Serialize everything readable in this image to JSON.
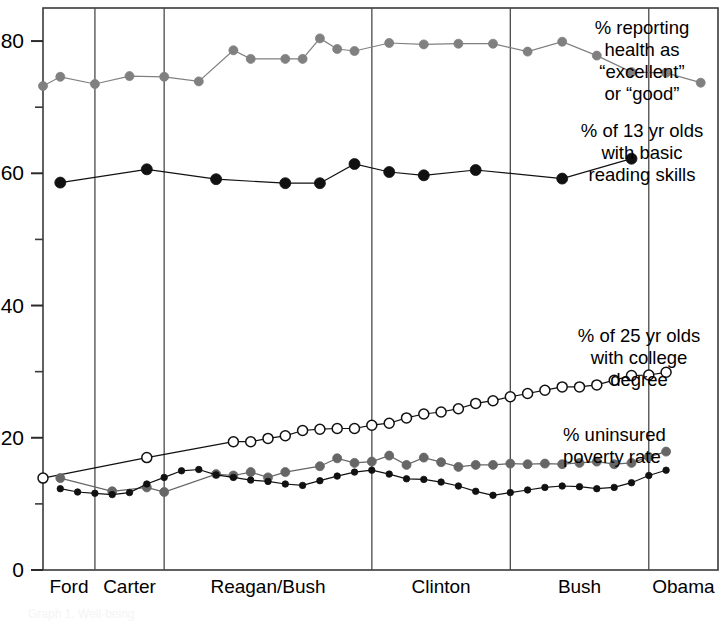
{
  "chart_data": {
    "type": "line",
    "title": "",
    "subtitle": "",
    "xlabel": "",
    "ylabel": "",
    "ylim": [
      0,
      85
    ],
    "yticks": [
      0,
      20,
      40,
      60,
      80
    ],
    "ytick_labels": [
      "0",
      "20",
      "40",
      "60",
      "80"
    ],
    "yminor": [
      10,
      30,
      50,
      70
    ],
    "grid": false,
    "legend_position": "right-inline",
    "xlim": [
      1974,
      2013
    ],
    "periods": [
      {
        "label": "Ford",
        "start": 1974,
        "end": 1977
      },
      {
        "label": "Carter",
        "start": 1977,
        "end": 1981
      },
      {
        "label": "Reagan/Bush",
        "start": 1981,
        "end": 1993
      },
      {
        "label": "Clinton",
        "start": 1993,
        "end": 2001
      },
      {
        "label": "Bush",
        "start": 2001,
        "end": 2009
      },
      {
        "label": "Obama",
        "start": 2009,
        "end": 2013
      }
    ],
    "series": [
      {
        "name": "% reporting health as “excellent” or “good”",
        "annotation": "% reporting\nhealth as\n“excellent”\nor  “good”",
        "marker": "filled-circle",
        "color": "#808080",
        "marker_size": 9,
        "points": [
          {
            "x": 1974,
            "y": 73.2
          },
          {
            "x": 1975,
            "y": 74.6
          },
          {
            "x": 1977,
            "y": 73.5
          },
          {
            "x": 1979,
            "y": 74.7
          },
          {
            "x": 1981,
            "y": 74.6
          },
          {
            "x": 1983,
            "y": 73.9
          },
          {
            "x": 1985,
            "y": 78.6
          },
          {
            "x": 1986,
            "y": 77.3
          },
          {
            "x": 1988,
            "y": 77.3
          },
          {
            "x": 1989,
            "y": 77.3
          },
          {
            "x": 1990,
            "y": 80.4
          },
          {
            "x": 1991,
            "y": 78.8
          },
          {
            "x": 1992,
            "y": 78.5
          },
          {
            "x": 1994,
            "y": 79.7
          },
          {
            "x": 1996,
            "y": 79.5
          },
          {
            "x": 1998,
            "y": 79.6
          },
          {
            "x": 2000,
            "y": 79.6
          },
          {
            "x": 2002,
            "y": 78.4
          },
          {
            "x": 2004,
            "y": 79.9
          },
          {
            "x": 2006,
            "y": 77.8
          },
          {
            "x": 2008,
            "y": 75.3
          },
          {
            "x": 2010,
            "y": 75.2
          },
          {
            "x": 2012,
            "y": 73.7
          }
        ]
      },
      {
        "name": "% of 13 yr olds with basic reading skills",
        "annotation": "% of 13 yr olds\nwith basic\nreading skills",
        "marker": "filled-circle",
        "color": "#111111",
        "marker_size": 11,
        "points": [
          {
            "x": 1975,
            "y": 58.6
          },
          {
            "x": 1980,
            "y": 60.6
          },
          {
            "x": 1984,
            "y": 59.1
          },
          {
            "x": 1988,
            "y": 58.5
          },
          {
            "x": 1990,
            "y": 58.5
          },
          {
            "x": 1992,
            "y": 61.4
          },
          {
            "x": 1994,
            "y": 60.2
          },
          {
            "x": 1996,
            "y": 59.7
          },
          {
            "x": 1999,
            "y": 60.5
          },
          {
            "x": 2004,
            "y": 59.2
          },
          {
            "x": 2008,
            "y": 62.2
          }
        ]
      },
      {
        "name": "% of 25 yr olds with college degree",
        "annotation": "% of 25 yr olds\nwith college\ndegree",
        "marker": "open-circle",
        "color": "#111111",
        "marker_size": 10,
        "points": [
          {
            "x": 1974,
            "y": 13.9
          },
          {
            "x": 1980,
            "y": 17.0
          },
          {
            "x": 1985,
            "y": 19.4
          },
          {
            "x": 1986,
            "y": 19.4
          },
          {
            "x": 1987,
            "y": 19.9
          },
          {
            "x": 1988,
            "y": 20.3
          },
          {
            "x": 1989,
            "y": 21.1
          },
          {
            "x": 1990,
            "y": 21.3
          },
          {
            "x": 1991,
            "y": 21.4
          },
          {
            "x": 1992,
            "y": 21.4
          },
          {
            "x": 1993,
            "y": 21.9
          },
          {
            "x": 1994,
            "y": 22.2
          },
          {
            "x": 1995,
            "y": 23.0
          },
          {
            "x": 1996,
            "y": 23.6
          },
          {
            "x": 1997,
            "y": 23.9
          },
          {
            "x": 1998,
            "y": 24.4
          },
          {
            "x": 1999,
            "y": 25.2
          },
          {
            "x": 2000,
            "y": 25.6
          },
          {
            "x": 2001,
            "y": 26.2
          },
          {
            "x": 2002,
            "y": 26.7
          },
          {
            "x": 2003,
            "y": 27.2
          },
          {
            "x": 2004,
            "y": 27.7
          },
          {
            "x": 2005,
            "y": 27.7
          },
          {
            "x": 2006,
            "y": 28.0
          },
          {
            "x": 2007,
            "y": 28.7
          },
          {
            "x": 2008,
            "y": 29.4
          },
          {
            "x": 2009,
            "y": 29.5
          },
          {
            "x": 2010,
            "y": 29.9
          }
        ]
      },
      {
        "name": "% uninsured",
        "annotation": "% uninsured",
        "marker": "filled-circle",
        "color": "#666666",
        "marker_size": 9,
        "points": [
          {
            "x": 1975,
            "y": 13.9
          },
          {
            "x": 1978,
            "y": 11.9
          },
          {
            "x": 1980,
            "y": 12.5
          },
          {
            "x": 1981,
            "y": 11.8
          },
          {
            "x": 1984,
            "y": 14.5
          },
          {
            "x": 1985,
            "y": 14.3
          },
          {
            "x": 1986,
            "y": 14.8
          },
          {
            "x": 1987,
            "y": 14.0
          },
          {
            "x": 1988,
            "y": 14.8
          },
          {
            "x": 1990,
            "y": 15.7
          },
          {
            "x": 1991,
            "y": 16.9
          },
          {
            "x": 1992,
            "y": 16.2
          },
          {
            "x": 1993,
            "y": 16.4
          },
          {
            "x": 1994,
            "y": 17.3
          },
          {
            "x": 1995,
            "y": 15.9
          },
          {
            "x": 1996,
            "y": 17.0
          },
          {
            "x": 1997,
            "y": 16.3
          },
          {
            "x": 1998,
            "y": 15.6
          },
          {
            "x": 1999,
            "y": 15.9
          },
          {
            "x": 2000,
            "y": 15.9
          },
          {
            "x": 2001,
            "y": 16.1
          },
          {
            "x": 2002,
            "y": 16.0
          },
          {
            "x": 2003,
            "y": 16.1
          },
          {
            "x": 2004,
            "y": 16.0
          },
          {
            "x": 2005,
            "y": 16.2
          },
          {
            "x": 2006,
            "y": 16.4
          },
          {
            "x": 2007,
            "y": 16.0
          },
          {
            "x": 2008,
            "y": 16.2
          },
          {
            "x": 2009,
            "y": 17.1
          },
          {
            "x": 2010,
            "y": 17.9
          }
        ]
      },
      {
        "name": "poverty rate",
        "annotation": "poverty rate",
        "marker": "filled-circle",
        "color": "#111111",
        "marker_size": 6.5,
        "points": [
          {
            "x": 1975,
            "y": 12.3
          },
          {
            "x": 1976,
            "y": 11.8
          },
          {
            "x": 1977,
            "y": 11.6
          },
          {
            "x": 1978,
            "y": 11.4
          },
          {
            "x": 1979,
            "y": 11.7
          },
          {
            "x": 1980,
            "y": 13.0
          },
          {
            "x": 1981,
            "y": 14.0
          },
          {
            "x": 1982,
            "y": 15.0
          },
          {
            "x": 1983,
            "y": 15.2
          },
          {
            "x": 1984,
            "y": 14.4
          },
          {
            "x": 1985,
            "y": 14.0
          },
          {
            "x": 1986,
            "y": 13.6
          },
          {
            "x": 1987,
            "y": 13.4
          },
          {
            "x": 1988,
            "y": 13.0
          },
          {
            "x": 1989,
            "y": 12.8
          },
          {
            "x": 1990,
            "y": 13.5
          },
          {
            "x": 1991,
            "y": 14.2
          },
          {
            "x": 1992,
            "y": 14.8
          },
          {
            "x": 1993,
            "y": 15.1
          },
          {
            "x": 1994,
            "y": 14.5
          },
          {
            "x": 1995,
            "y": 13.8
          },
          {
            "x": 1996,
            "y": 13.7
          },
          {
            "x": 1997,
            "y": 13.3
          },
          {
            "x": 1998,
            "y": 12.7
          },
          {
            "x": 1999,
            "y": 11.9
          },
          {
            "x": 2000,
            "y": 11.3
          },
          {
            "x": 2001,
            "y": 11.7
          },
          {
            "x": 2002,
            "y": 12.1
          },
          {
            "x": 2003,
            "y": 12.5
          },
          {
            "x": 2004,
            "y": 12.7
          },
          {
            "x": 2005,
            "y": 12.6
          },
          {
            "x": 2006,
            "y": 12.3
          },
          {
            "x": 2007,
            "y": 12.5
          },
          {
            "x": 2008,
            "y": 13.2
          },
          {
            "x": 2009,
            "y": 14.3
          },
          {
            "x": 2010,
            "y": 15.1
          }
        ]
      }
    ]
  },
  "annotations": {
    "health": "% reporting\nhealth as\n“excellent”\nor  “good”",
    "reading": "% of 13 yr olds\nwith basic\nreading skills",
    "college": "% of 25 yr olds\nwith college\ndegree",
    "uninsured": "% uninsured\npoverty rate"
  },
  "footer": {
    "note": "Graph 1. Well-being"
  }
}
